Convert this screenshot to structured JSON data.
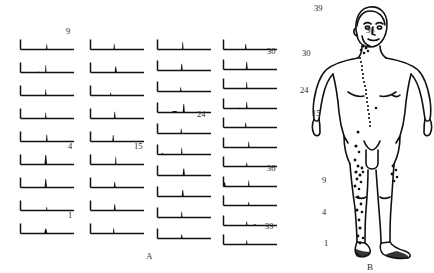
{
  "figure": {
    "panel_a_caption": "A",
    "panel_b_caption": "B"
  },
  "chart_data": {
    "type": "line",
    "title": "",
    "subtitle": "",
    "xlabel": "",
    "ylabel": "",
    "grid": false,
    "legend": null,
    "axis_ranges": {
      "x": [
        0,
        1
      ],
      "y": [
        0,
        1
      ]
    },
    "annotations": [
      "9",
      "4",
      "1",
      "15",
      "24",
      "30",
      "36",
      "39"
    ],
    "columns": [
      {
        "index": 1,
        "x": 18,
        "y_start": 33,
        "row_pitch": 23,
        "panels": [
          {
            "id": 9,
            "label": "9",
            "label_dx": 48,
            "label_dy": -6,
            "peaks": [
              {
                "x": 0.52,
                "h": 0.55,
                "w": 1.6
              }
            ],
            "bumps": []
          },
          {
            "id": 8,
            "label": "",
            "peaks": [
              {
                "x": 0.5,
                "h": 0.8,
                "w": 1.5
              }
            ],
            "bumps": [
              {
                "x": 0.36,
                "h": 0.1,
                "w": 5
              }
            ]
          },
          {
            "id": 7,
            "label": "",
            "peaks": [
              {
                "x": 0.5,
                "h": 0.62,
                "w": 1.5
              }
            ],
            "bumps": []
          },
          {
            "id": 6,
            "label": "",
            "peaks": [
              {
                "x": 0.5,
                "h": 0.6,
                "w": 1.5
              }
            ],
            "bumps": []
          },
          {
            "id": 5,
            "label": "",
            "peaks": [
              {
                "x": 0.52,
                "h": 0.72,
                "w": 1.8
              }
            ],
            "bumps": []
          },
          {
            "id": 4,
            "label": "4",
            "label_dx": 50,
            "label_dy": -6,
            "peaks": [
              {
                "x": 0.5,
                "h": 1.0,
                "w": 2.6
              }
            ],
            "bumps": []
          },
          {
            "id": 3,
            "label": "",
            "peaks": [
              {
                "x": 0.5,
                "h": 0.9,
                "w": 2.4
              }
            ],
            "bumps": []
          },
          {
            "id": 2,
            "label": "",
            "peaks": [
              {
                "x": 0.52,
                "h": 0.38,
                "w": 1.4
              }
            ],
            "bumps": []
          },
          {
            "id": 1,
            "label": "1",
            "label_dx": 50,
            "label_dy": -6,
            "peaks": [
              {
                "x": 0.5,
                "h": 0.5,
                "w": 3.2
              }
            ],
            "bumps": []
          }
        ]
      },
      {
        "index": 2,
        "x": 88,
        "y_start": 33,
        "row_pitch": 23,
        "panels": [
          {
            "id": 18,
            "label": "",
            "peaks": [
              {
                "x": 0.47,
                "h": 0.6,
                "w": 1.5
              }
            ],
            "bumps": []
          },
          {
            "id": 17,
            "label": "",
            "peaks": [
              {
                "x": 0.5,
                "h": 0.62,
                "w": 2.2
              }
            ],
            "bumps": []
          },
          {
            "id": 16,
            "label": "",
            "peaks": [
              {
                "x": 0.4,
                "h": 0.32,
                "w": 1.3
              }
            ],
            "bumps": []
          },
          {
            "id": 15,
            "label": "",
            "peaks": [
              {
                "x": 0.48,
                "h": 0.72,
                "w": 1.8
              }
            ],
            "bumps": []
          },
          {
            "id": 14,
            "label": "",
            "peaks": [
              {
                "x": 0.45,
                "h": 0.68,
                "w": 1.8
              }
            ],
            "bumps": []
          },
          {
            "id": 13,
            "label": "15",
            "label_dx": 46,
            "label_dy": -6,
            "peaks": [
              {
                "x": 0.5,
                "h": 0.82,
                "w": 1.4
              }
            ],
            "bumps": []
          },
          {
            "id": 12,
            "label": "",
            "peaks": [
              {
                "x": 0.48,
                "h": 0.58,
                "w": 2.0
              }
            ],
            "bumps": []
          },
          {
            "id": 11,
            "label": "",
            "peaks": [
              {
                "x": 0.48,
                "h": 0.66,
                "w": 2.0
              }
            ],
            "bumps": []
          },
          {
            "id": 10,
            "label": "",
            "peaks": [
              {
                "x": 0.46,
                "h": 0.55,
                "w": 1.6
              }
            ],
            "bumps": []
          }
        ]
      },
      {
        "index": 3,
        "x": 155,
        "y_start": 33,
        "row_pitch": 21,
        "panels": [
          {
            "id": 28,
            "label": "",
            "peaks": [
              {
                "x": 0.5,
                "h": 0.78,
                "w": 1.6
              }
            ],
            "bumps": []
          },
          {
            "id": 27,
            "label": "",
            "peaks": [
              {
                "x": 0.48,
                "h": 0.7,
                "w": 2.0
              }
            ],
            "bumps": []
          },
          {
            "id": 26,
            "label": "",
            "peaks": [
              {
                "x": 0.46,
                "h": 0.45,
                "w": 1.5
              }
            ],
            "bumps": []
          },
          {
            "id": 25,
            "label": "",
            "peaks": [
              {
                "x": 0.52,
                "h": 0.9,
                "w": 2.2
              }
            ],
            "bumps": [
              {
                "x": 0.34,
                "h": 0.22,
                "w": 8
              }
            ]
          },
          {
            "id": 24,
            "label": "24",
            "label_dx": 42,
            "label_dy": -7,
            "peaks": [
              {
                "x": 0.47,
                "h": 0.5,
                "w": 1.6
              }
            ],
            "bumps": []
          },
          {
            "id": 23,
            "label": "",
            "peaks": [
              {
                "x": 0.48,
                "h": 0.72,
                "w": 1.5
              }
            ],
            "bumps": [
              {
                "x": 0.1,
                "h": 0.18,
                "w": 3
              }
            ]
          },
          {
            "id": 22,
            "label": "",
            "peaks": [
              {
                "x": 0.52,
                "h": 0.75,
                "w": 2.4
              }
            ],
            "bumps": []
          },
          {
            "id": 21,
            "label": "",
            "peaks": [
              {
                "x": 0.5,
                "h": 0.68,
                "w": 2.2
              }
            ],
            "bumps": []
          },
          {
            "id": 20,
            "label": "",
            "peaks": [
              {
                "x": 0.48,
                "h": 0.6,
                "w": 1.5
              }
            ],
            "bumps": []
          },
          {
            "id": 19,
            "label": "",
            "peaks": [
              {
                "x": 0.48,
                "h": 0.42,
                "w": 1.8
              }
            ],
            "bumps": []
          }
        ]
      },
      {
        "index": 4,
        "x": 221,
        "y_start": 33,
        "row_pitch": 19.5,
        "panels": [
          {
            "id": 39,
            "label": "",
            "peaks": [
              {
                "x": 0.44,
                "h": 0.58,
                "w": 1.8
              }
            ],
            "bumps": []
          },
          {
            "id": 38,
            "label": "30",
            "label_dx": 46,
            "label_dy": -6,
            "peaks": [
              {
                "x": 0.46,
                "h": 0.82,
                "w": 2.0
              }
            ],
            "bumps": []
          },
          {
            "id": 37,
            "label": "",
            "peaks": [
              {
                "x": 0.46,
                "h": 0.72,
                "w": 1.4
              }
            ],
            "bumps": []
          },
          {
            "id": 36,
            "label": "",
            "peaks": [
              {
                "x": 0.46,
                "h": 0.7,
                "w": 1.6
              }
            ],
            "bumps": [
              {
                "x": 0.3,
                "h": 0.12,
                "w": 6
              }
            ]
          },
          {
            "id": 35,
            "label": "",
            "peaks": [
              {
                "x": 0.44,
                "h": 0.52,
                "w": 1.6
              }
            ],
            "bumps": []
          },
          {
            "id": 34,
            "label": "",
            "peaks": [
              {
                "x": 0.5,
                "h": 0.62,
                "w": 1.5
              }
            ],
            "bumps": []
          },
          {
            "id": 33,
            "label": "",
            "peaks": [
              {
                "x": 0.46,
                "h": 0.4,
                "w": 1.6
              }
            ],
            "bumps": []
          },
          {
            "id": 32,
            "label": "36",
            "label_dx": 46,
            "label_dy": -6,
            "peaks": [
              {
                "x": 0.5,
                "h": 0.62,
                "w": 1.5
              }
            ],
            "bumps": [
              {
                "x": 0.02,
                "h": 0.6,
                "w": 2.4
              }
            ]
          },
          {
            "id": 31,
            "label": "",
            "peaks": [
              {
                "x": 0.5,
                "h": 0.38,
                "w": 1.5
              }
            ],
            "bumps": []
          },
          {
            "id": 30,
            "label": "",
            "peaks": [
              {
                "x": 0.46,
                "h": 0.45,
                "w": 1.5
              }
            ],
            "bumps": [
              {
                "x": 0.62,
                "h": 0.22,
                "w": 2.4
              }
            ]
          },
          {
            "id": 29,
            "label": "39",
            "label_dx": 44,
            "label_dy": -6,
            "peaks": [
              {
                "x": 0.46,
                "h": 0.45,
                "w": 1.6
              }
            ],
            "bumps": []
          }
        ]
      }
    ]
  },
  "body": {
    "caption": "B",
    "labels": [
      {
        "text": "39",
        "x": 14,
        "y": 3
      },
      {
        "text": "36",
        "x": 66,
        "y": 25
      },
      {
        "text": "30",
        "x": 2,
        "y": 48
      },
      {
        "text": "24",
        "x": 0,
        "y": 85
      },
      {
        "text": "15",
        "x": 12,
        "y": 108
      },
      {
        "text": "9",
        "x": 22,
        "y": 175
      },
      {
        "text": "4",
        "x": 22,
        "y": 207
      },
      {
        "text": "1",
        "x": 24,
        "y": 238
      }
    ],
    "lesion_dots": [
      {
        "x": 63,
        "y": 46,
        "r": 1.5
      },
      {
        "x": 66,
        "y": 48,
        "r": 1.4
      },
      {
        "x": 61,
        "y": 50,
        "r": 1.3
      },
      {
        "x": 68,
        "y": 51,
        "r": 1.2
      },
      {
        "x": 64,
        "y": 53,
        "r": 1.3
      },
      {
        "x": 60,
        "y": 58,
        "r": 1.1
      },
      {
        "x": 61,
        "y": 62,
        "r": 1.1
      },
      {
        "x": 62,
        "y": 66,
        "r": 1.1
      },
      {
        "x": 62,
        "y": 70,
        "r": 1.1
      },
      {
        "x": 63,
        "y": 74,
        "r": 1.1
      },
      {
        "x": 63,
        "y": 78,
        "r": 1.1
      },
      {
        "x": 64,
        "y": 82,
        "r": 1.1
      },
      {
        "x": 65,
        "y": 86,
        "r": 1.1
      },
      {
        "x": 66,
        "y": 90,
        "r": 1.1
      },
      {
        "x": 66,
        "y": 94,
        "r": 1.1
      },
      {
        "x": 67,
        "y": 98,
        "r": 1.1
      },
      {
        "x": 67,
        "y": 102,
        "r": 1.1
      },
      {
        "x": 68,
        "y": 106,
        "r": 1.1
      },
      {
        "x": 68,
        "y": 110,
        "r": 1.1
      },
      {
        "x": 69,
        "y": 114,
        "r": 1.1
      },
      {
        "x": 69,
        "y": 118,
        "r": 1.1
      },
      {
        "x": 70,
        "y": 122,
        "r": 1.1
      },
      {
        "x": 70,
        "y": 126,
        "r": 1.1
      },
      {
        "x": 76,
        "y": 108,
        "r": 1.3
      },
      {
        "x": 58,
        "y": 132,
        "r": 1.5
      },
      {
        "x": 56,
        "y": 146,
        "r": 1.6
      },
      {
        "x": 59,
        "y": 152,
        "r": 1.3
      },
      {
        "x": 55,
        "y": 160,
        "r": 1.4
      },
      {
        "x": 58,
        "y": 166,
        "r": 1.5
      },
      {
        "x": 62,
        "y": 168,
        "r": 1.4
      },
      {
        "x": 56,
        "y": 172,
        "r": 1.6
      },
      {
        "x": 60,
        "y": 175,
        "r": 1.5
      },
      {
        "x": 63,
        "y": 172,
        "r": 1.3
      },
      {
        "x": 57,
        "y": 179,
        "r": 1.4
      },
      {
        "x": 61,
        "y": 182,
        "r": 1.3
      },
      {
        "x": 55,
        "y": 186,
        "r": 1.5
      },
      {
        "x": 59,
        "y": 189,
        "r": 1.3
      },
      {
        "x": 58,
        "y": 197,
        "r": 1.5
      },
      {
        "x": 61,
        "y": 204,
        "r": 1.4
      },
      {
        "x": 57,
        "y": 210,
        "r": 1.5
      },
      {
        "x": 62,
        "y": 212,
        "r": 1.3
      },
      {
        "x": 59,
        "y": 220,
        "r": 1.4
      },
      {
        "x": 60,
        "y": 228,
        "r": 1.5
      },
      {
        "x": 58,
        "y": 236,
        "r": 1.4
      },
      {
        "x": 63,
        "y": 238,
        "r": 1.3
      },
      {
        "x": 60,
        "y": 243,
        "r": 1.4
      },
      {
        "x": 93,
        "y": 166,
        "r": 1.4
      },
      {
        "x": 96,
        "y": 170,
        "r": 1.3
      },
      {
        "x": 92,
        "y": 174,
        "r": 1.4
      },
      {
        "x": 97,
        "y": 177,
        "r": 1.3
      },
      {
        "x": 94,
        "y": 181,
        "r": 1.3
      }
    ]
  }
}
